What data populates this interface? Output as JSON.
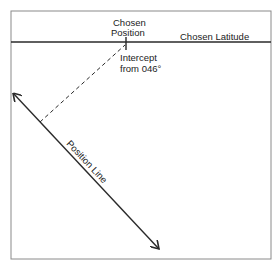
{
  "diagram": {
    "labels": {
      "chosen_position_line1": "Chosen",
      "chosen_position_line2": "Position",
      "chosen_latitude": "Chosen Latitude",
      "intercept_line1": "Intercept",
      "intercept_line2": "from 046°",
      "position_line": "Position Line"
    },
    "colors": {
      "frame": "#8a8a8a",
      "line": "#2a2a2a",
      "text": "#222222"
    }
  }
}
